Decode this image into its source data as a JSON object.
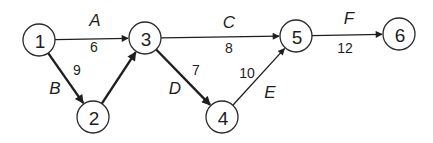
{
  "diagram": {
    "type": "activity-network",
    "nodes": [
      {
        "id": "1",
        "label": "1",
        "x": 39,
        "y": 40,
        "r": 16
      },
      {
        "id": "2",
        "label": "2",
        "x": 93,
        "y": 117,
        "r": 16
      },
      {
        "id": "3",
        "label": "3",
        "x": 145,
        "y": 38,
        "r": 16
      },
      {
        "id": "4",
        "label": "4",
        "x": 222,
        "y": 117,
        "r": 16
      },
      {
        "id": "5",
        "label": "5",
        "x": 296,
        "y": 36,
        "r": 16
      },
      {
        "id": "6",
        "label": "6",
        "x": 399,
        "y": 34,
        "r": 16
      }
    ],
    "edges": [
      {
        "id": "A",
        "from": "1",
        "to": "3",
        "activity": "A",
        "duration": "6",
        "bold": false
      },
      {
        "id": "B",
        "from": "1",
        "to": "2",
        "activity": "B",
        "duration": "9",
        "bold": true
      },
      {
        "id": "dummy",
        "from": "2",
        "to": "3",
        "activity": "",
        "duration": "",
        "bold": true
      },
      {
        "id": "C",
        "from": "3",
        "to": "5",
        "activity": "C",
        "duration": "8",
        "bold": false
      },
      {
        "id": "D",
        "from": "3",
        "to": "4",
        "activity": "D",
        "duration": "7",
        "bold": true
      },
      {
        "id": "E",
        "from": "4",
        "to": "5",
        "activity": "E",
        "duration": "10",
        "bold": false
      },
      {
        "id": "F",
        "from": "5",
        "to": "6",
        "activity": "F",
        "duration": "12",
        "bold": false
      }
    ],
    "labels": {
      "A": {
        "letter": "A",
        "weight": "6",
        "lx": 95,
        "ly": 20,
        "wx": 94,
        "wy": 47
      },
      "B": {
        "letter": "B",
        "weight": "9",
        "lx": 55,
        "ly": 88,
        "wx": 77,
        "wy": 70
      },
      "C": {
        "letter": "C",
        "weight": "8",
        "lx": 229,
        "ly": 22,
        "wx": 229,
        "wy": 48
      },
      "D": {
        "letter": "D",
        "weight": "7",
        "lx": 175,
        "ly": 88,
        "wx": 196,
        "wy": 70
      },
      "E": {
        "letter": "E",
        "weight": "10",
        "lx": 270,
        "ly": 92,
        "wx": 247,
        "wy": 73
      },
      "F": {
        "letter": "F",
        "weight": "12",
        "lx": 349,
        "ly": 18,
        "wx": 345,
        "wy": 48
      }
    },
    "colors": {
      "stroke": "#1e1e1e",
      "node_fill": "#ffffff",
      "background": "#ffffff"
    }
  }
}
